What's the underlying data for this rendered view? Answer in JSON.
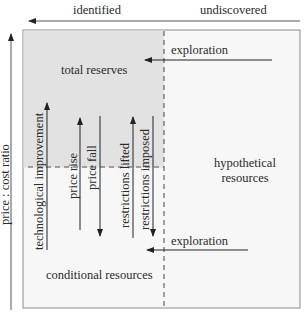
{
  "header": {
    "left_label": "identified",
    "right_label": "undiscovered"
  },
  "axis": {
    "y_label": "price : cost ratio"
  },
  "regions": {
    "total_reserves": "total reserves",
    "hypothetical_line1": "hypothetical",
    "hypothetical_line2": "resources",
    "conditional_resources": "conditional resources"
  },
  "arrows": {
    "exploration_top": "exploration",
    "exploration_bottom": "exploration",
    "technological_improvement": "technological improvement",
    "price_rise": "price rise",
    "price_fall": "price fall",
    "restrictions_lifted": "restrictions lifted",
    "restrictions_imposed": "restrictions imposed"
  },
  "colors": {
    "shaded_region": "#e4e4e4",
    "box_fill": "#f7f7f7",
    "line": "#333333",
    "border": "#8a8a8a"
  }
}
